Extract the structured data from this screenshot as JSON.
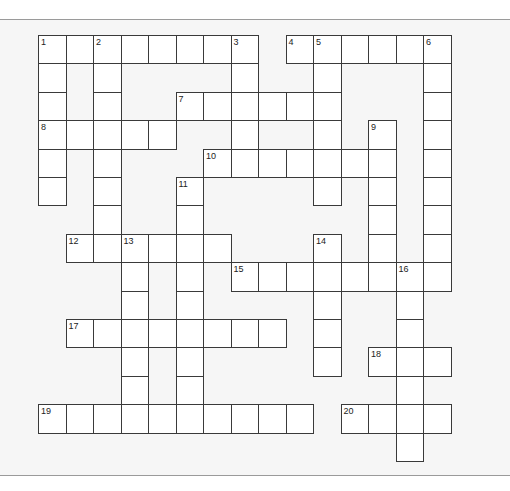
{
  "puzzle": {
    "type": "crossword",
    "rows": 15,
    "cols": 15,
    "cell_width": 27.5,
    "cell_height": 28.4,
    "colors": {
      "background": "#f6f6f6",
      "cell_fill": "#ffffff",
      "cell_border": "#3a3a3a",
      "rule": "#9a9a9a"
    },
    "entries": [
      {
        "number": "1",
        "direction": "across",
        "row": 0,
        "col": 0,
        "length": 8
      },
      {
        "number": "4",
        "direction": "across",
        "row": 0,
        "col": 9,
        "length": 6
      },
      {
        "number": "1",
        "direction": "down",
        "row": 0,
        "col": 0,
        "length": 6
      },
      {
        "number": "2",
        "direction": "down",
        "row": 0,
        "col": 2,
        "length": 8
      },
      {
        "number": "3",
        "direction": "down",
        "row": 0,
        "col": 7,
        "length": 5
      },
      {
        "number": "5",
        "direction": "down",
        "row": 0,
        "col": 10,
        "length": 6
      },
      {
        "number": "6",
        "direction": "down",
        "row": 0,
        "col": 14,
        "length": 9
      },
      {
        "number": "7",
        "direction": "across",
        "row": 2,
        "col": 5,
        "length": 6
      },
      {
        "number": "8",
        "direction": "across",
        "row": 3,
        "col": 0,
        "length": 5
      },
      {
        "number": "9",
        "direction": "down",
        "row": 3,
        "col": 12,
        "length": 6
      },
      {
        "number": "10",
        "direction": "across",
        "row": 4,
        "col": 6,
        "length": 7
      },
      {
        "number": "11",
        "direction": "down",
        "row": 5,
        "col": 5,
        "length": 9
      },
      {
        "number": "12",
        "direction": "across",
        "row": 7,
        "col": 1,
        "length": 6
      },
      {
        "number": "13",
        "direction": "down",
        "row": 7,
        "col": 3,
        "length": 7
      },
      {
        "number": "14",
        "direction": "down",
        "row": 7,
        "col": 10,
        "length": 5
      },
      {
        "number": "15",
        "direction": "across",
        "row": 8,
        "col": 7,
        "length": 8
      },
      {
        "number": "16",
        "direction": "down",
        "row": 8,
        "col": 13,
        "length": 7
      },
      {
        "number": "17",
        "direction": "across",
        "row": 10,
        "col": 1,
        "length": 8
      },
      {
        "number": "18",
        "direction": "across",
        "row": 11,
        "col": 12,
        "length": 3
      },
      {
        "number": "19",
        "direction": "across",
        "row": 13,
        "col": 0,
        "length": 10
      },
      {
        "number": "20",
        "direction": "across",
        "row": 13,
        "col": 11,
        "length": 4
      }
    ]
  }
}
